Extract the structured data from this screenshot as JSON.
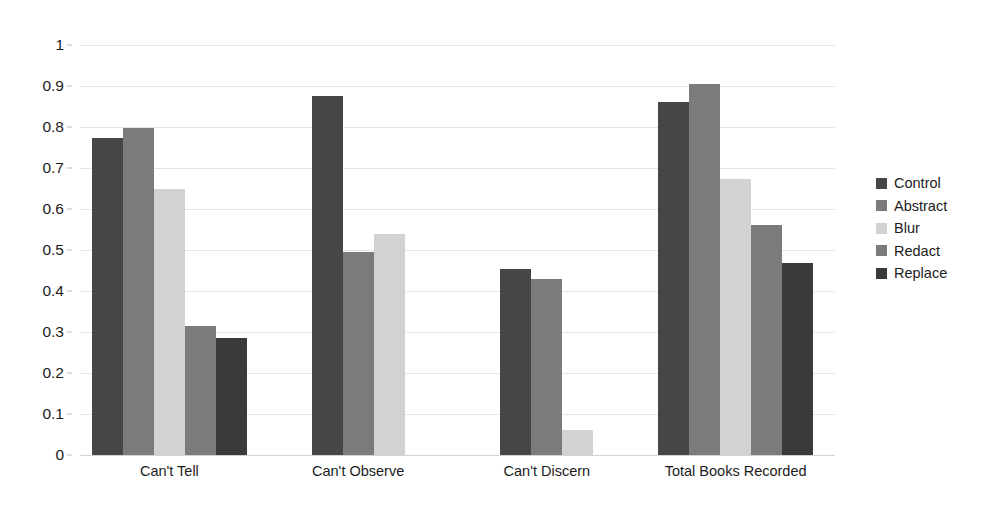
{
  "chart_data": {
    "type": "bar",
    "title": "",
    "subtitle": "",
    "xlabel": "",
    "ylabel": "",
    "categories": [
      "Can't Tell",
      "Can't Observe",
      "Can't Discern",
      "Total Books Recorded"
    ],
    "series": [
      {
        "name": "Control",
        "color": "#464646",
        "values": [
          0.773,
          0.875,
          0.453,
          0.861
        ]
      },
      {
        "name": "Abstract",
        "color": "#7b7b7b",
        "values": [
          0.797,
          0.495,
          0.43,
          0.905
        ]
      },
      {
        "name": "Blur",
        "color": "#d2d2d2",
        "values": [
          0.648,
          0.54,
          0.061,
          0.672
        ]
      },
      {
        "name": "Redact",
        "color": "#7b7b7b",
        "values": [
          0.315,
          null,
          null,
          0.561
        ]
      },
      {
        "name": "Replace",
        "color": "#3a3a3a",
        "values": [
          0.286,
          null,
          null,
          0.468
        ]
      }
    ],
    "ylim": [
      0,
      1
    ],
    "ytick_labels": [
      "1",
      "0.9",
      "0.8",
      "0.7",
      "0.6",
      "0.5",
      "0.4",
      "0.3",
      "0.2",
      "0.1",
      "0"
    ],
    "ytick_values": [
      1,
      0.9,
      0.8,
      0.7,
      0.6,
      0.5,
      0.4,
      0.3,
      0.2,
      0.1,
      0
    ],
    "grid": true,
    "legend_position": "right",
    "legend_entries": [
      "Control",
      "Abstract",
      "Blur",
      "Redact",
      "Replace"
    ],
    "background_color": "#ffffff",
    "gridline_color": "#e2e6ea",
    "text_color": "#1c1c1c"
  }
}
